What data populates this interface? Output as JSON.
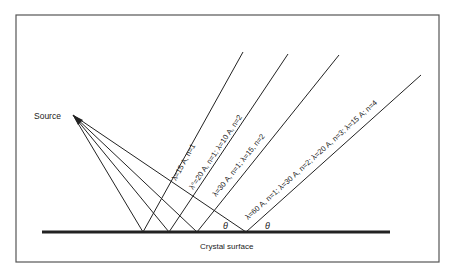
{
  "diagram": {
    "source_label": "Source",
    "surface_label": "Crystal surface",
    "angle_symbol": "θ",
    "colors": {
      "line": "#222222",
      "frame": "#555555",
      "background": "#ffffff"
    },
    "source_point": [
      73,
      115
    ],
    "surface": {
      "y": 232,
      "x1": 42,
      "x2": 390
    },
    "rays": [
      {
        "hit": [
          143,
          232
        ],
        "end": [
          243,
          52
        ],
        "label": "λ=15 A, n=1"
      },
      {
        "hit": [
          169,
          232
        ],
        "end": [
          288,
          54
        ],
        "label": "λ°=20 A, n=1; λ=10 A, n=2"
      },
      {
        "hit": [
          197,
          232
        ],
        "end": [
          339,
          55
        ],
        "label": "λ=30 A, n=1; λ=15, n=2"
      },
      {
        "hit": [
          246,
          232
        ],
        "end": [
          421,
          75
        ],
        "label": "λ=60 A, n=1; λ=30 A, n=2; λ=20 A, n=3; λ=15 A; n=4"
      }
    ]
  }
}
